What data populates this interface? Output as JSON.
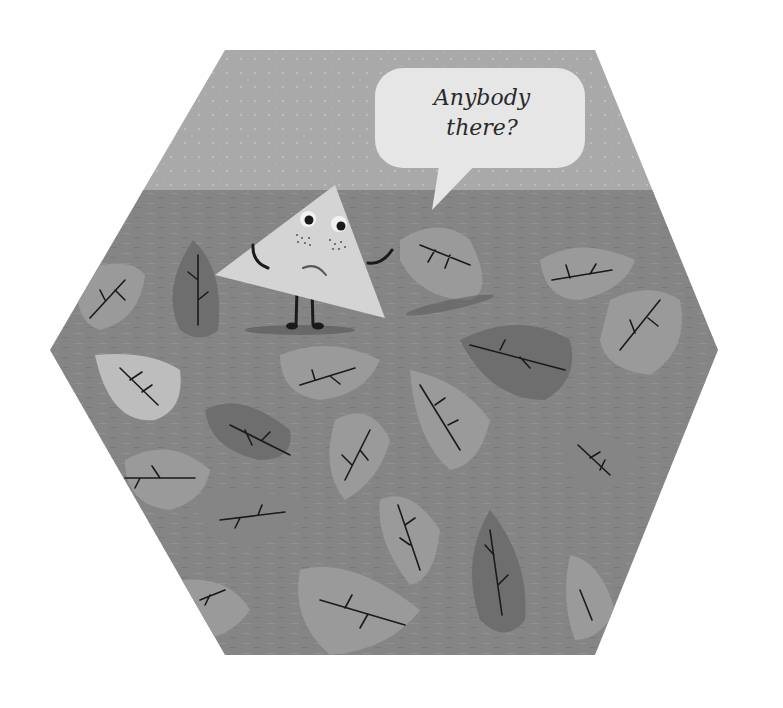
{
  "illustration": {
    "speech_bubble": {
      "line1": "Anybody",
      "line2": "there?"
    },
    "character": "sad-triangle",
    "colors": {
      "background": "#ffffff",
      "sky": "#a9a9a9",
      "ground": "#858585",
      "triangle": "#d4d4d4",
      "bubble": "#e6e6e6",
      "leaf_light": "#bdbdbd",
      "leaf_mid": "#9a9a9a",
      "leaf_dark": "#6e6e6e",
      "ink": "#1a1a1a"
    }
  }
}
